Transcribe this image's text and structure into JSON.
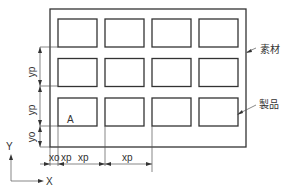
{
  "diagram": {
    "type": "layout-nesting",
    "material_label": "素材",
    "product_label": "製品",
    "first_product_label": "A",
    "grid": {
      "rows": 3,
      "columns": 4
    },
    "dimensions": {
      "x_offset": "xo",
      "x_pitch": "xp",
      "y_offset": "yo",
      "y_pitch": "yp"
    },
    "axes": {
      "x": "X",
      "y": "Y"
    }
  }
}
